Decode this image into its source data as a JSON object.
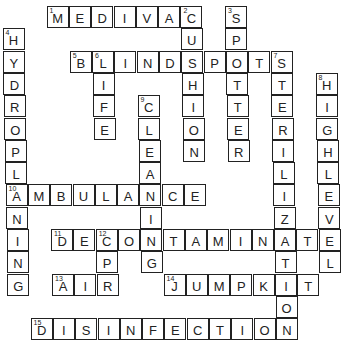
{
  "puzzle": {
    "type": "crossword",
    "grid": {
      "cell_size": 22.3,
      "origin_x": 2,
      "origin_y": 6,
      "skew_x_per_row": 0.45
    },
    "words": [
      {
        "number": "1",
        "answer": "MEDIVAC",
        "direction": "across",
        "row": 0,
        "col": 2
      },
      {
        "number": "2",
        "answer": "CUSHION",
        "direction": "down",
        "row": 0,
        "col": 8
      },
      {
        "number": "3",
        "answer": "SPOTTER",
        "direction": "down",
        "row": 0,
        "col": 10
      },
      {
        "number": "4",
        "answer": "HYDROPLANING",
        "direction": "down",
        "row": 1,
        "col": 0
      },
      {
        "number": "5",
        "answer": "BLINDSPOTS",
        "direction": "across",
        "row": 2,
        "col": 3
      },
      {
        "number": "6",
        "answer": "LIFE",
        "direction": "down",
        "row": 2,
        "col": 4
      },
      {
        "number": "7",
        "answer": "STERILIZATION",
        "direction": "down",
        "row": 2,
        "col": 12
      },
      {
        "number": "8",
        "answer": "HIGHLEVEL",
        "direction": "down",
        "row": 3,
        "col": 14
      },
      {
        "number": "9",
        "answer": "CLEANING",
        "direction": "down",
        "row": 4,
        "col": 6
      },
      {
        "number": "10",
        "answer": "AMBULANCE",
        "direction": "across",
        "row": 8,
        "col": 0
      },
      {
        "number": "11",
        "answer": "DECONTAMINATE",
        "direction": "across",
        "row": 10,
        "col": 2
      },
      {
        "number": "12",
        "answer": "CPR",
        "direction": "down",
        "row": 10,
        "col": 4
      },
      {
        "number": "13",
        "answer": "AIR",
        "direction": "across",
        "row": 12,
        "col": 2
      },
      {
        "number": "14",
        "answer": "JUMPKIT",
        "direction": "across",
        "row": 12,
        "col": 7
      },
      {
        "number": "15",
        "answer": "DISINFECTION",
        "direction": "across",
        "row": 14,
        "col": 1
      }
    ]
  }
}
